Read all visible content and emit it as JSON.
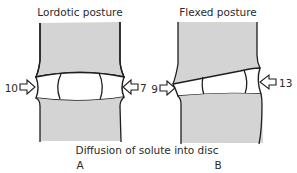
{
  "panels": [
    {
      "id": "A",
      "title": "Lordotic posture",
      "letter": "A",
      "left_value": "10",
      "right_value": "7"
    },
    {
      "id": "B",
      "title": "Flexed posture",
      "letter": "B",
      "left_value": "9",
      "right_value": "13"
    }
  ],
  "caption": "Diffusion of solute into disc",
  "colors": {
    "bone_fill": "#d4d4d4",
    "outline": "#1e1e1e",
    "disc_fill": "#ffffff"
  }
}
